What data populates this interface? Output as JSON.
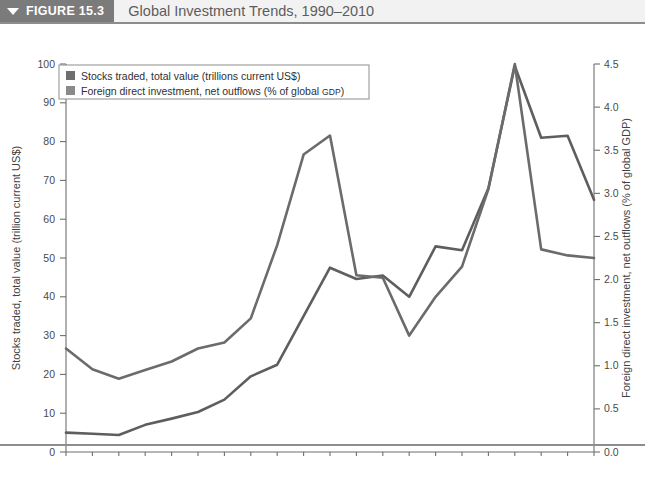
{
  "figure": {
    "tag_label": "FIGURE 15.3",
    "caret_icon": "triangle-down-icon",
    "title": "Global Investment Trends, 1990–2010"
  },
  "legend": {
    "position": "top-left-inside-plot",
    "entries": [
      {
        "swatch_color": "#6e6e6e",
        "label_main": "Stocks traded, total value (trillions current US$)",
        "label_small": ""
      },
      {
        "swatch_color": "#8a8a8a",
        "label_main": "Foreign direct investment, net outflows (% of global ",
        "label_small": "GDP",
        "label_tail": ")"
      }
    ]
  },
  "colors": {
    "stocks_line": "#5e5e5e",
    "fdi_line": "#6b6b6b",
    "axis": "#6f6f6f",
    "header_band": "#7b7b7b",
    "header_title_bg": "#f2f2f2",
    "rule": "#8d8d8d"
  },
  "chart_data": {
    "type": "line",
    "title": "Global Investment Trends, 1990–2010",
    "subtitle": "",
    "xlabel": "Year",
    "ylabel": "Stocks traded, total value (trillion current US$)",
    "y2label": "Foreign direct investment, net outflows (% of global GDP)",
    "grid": false,
    "legend_position": "upper left",
    "x": [
      1990,
      1991,
      1992,
      1993,
      1994,
      1995,
      1996,
      1997,
      1998,
      1999,
      2000,
      2001,
      2002,
      2003,
      2004,
      2005,
      2006,
      2007,
      2008,
      2009,
      2010
    ],
    "categories": [
      "1990",
      "1991",
      "1992",
      "1993",
      "1994",
      "1995",
      "1996",
      "1997",
      "1998",
      "1999",
      "2000",
      "2001",
      "2002",
      "2003",
      "2004",
      "2005",
      "2006",
      "2007",
      "2008",
      "2009",
      "2010"
    ],
    "xlim": [
      1990,
      2010
    ],
    "ylim": [
      0,
      100
    ],
    "ylim2": [
      0.0,
      4.5
    ],
    "yticks": [
      0,
      10,
      20,
      30,
      40,
      50,
      60,
      70,
      80,
      90,
      100
    ],
    "ytick_labels": [
      "0",
      "10",
      "20",
      "30",
      "40",
      "50",
      "60",
      "70",
      "80",
      "90",
      "100"
    ],
    "y2ticks": [
      0.0,
      0.5,
      1.0,
      1.5,
      2.0,
      2.5,
      3.0,
      3.5,
      4.0,
      4.5
    ],
    "y2tick_labels": [
      "0.0",
      "0.5",
      "1.0",
      "1.5",
      "2.0",
      "2.5",
      "3.0",
      "3.5",
      "4.0",
      "4.5"
    ],
    "series": [
      {
        "name": "Stocks traded, total value (trillions current US$)",
        "axis": "left",
        "color": "#5e5e5e",
        "values": [
          5.0,
          4.7,
          4.4,
          7.0,
          8.6,
          10.3,
          13.5,
          19.5,
          22.5,
          35.0,
          47.5,
          44.6,
          45.5,
          40.0,
          53.0,
          52.0,
          68.0,
          99.5,
          81.0,
          81.5,
          65.0
        ]
      },
      {
        "name": "Foreign direct investment, net outflows (% of global GDP)",
        "axis": "right",
        "color": "#6b6b6b",
        "values": [
          1.2,
          0.96,
          0.85,
          0.95,
          1.05,
          1.2,
          1.27,
          1.55,
          2.4,
          3.45,
          3.67,
          2.05,
          2.02,
          1.35,
          1.8,
          2.15,
          3.05,
          4.5,
          2.35,
          2.28,
          2.25
        ]
      }
    ]
  }
}
